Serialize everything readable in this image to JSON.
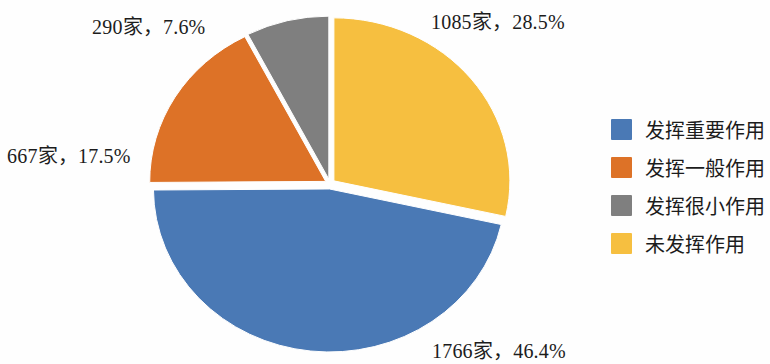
{
  "chart_data": {
    "type": "pie",
    "title": "",
    "subtitle": "",
    "xlabel": "",
    "ylabel": "",
    "legend_position": "right",
    "grid": false,
    "start_angle_deg": 0,
    "direction": "clockwise",
    "exploded": true,
    "unit_suffix": "家",
    "total_count": 3808,
    "categories": [
      "发挥重要作用",
      "发挥一般作用",
      "发挥很小作用",
      "未发挥作用"
    ],
    "values": [
      1766,
      667,
      290,
      1085
    ],
    "percentages": [
      46.4,
      17.5,
      7.6,
      28.5
    ],
    "colors": [
      "#4a79b5",
      "#dd7227",
      "#7f7f7f",
      "#f6bf40"
    ],
    "slices": [
      {
        "name": "发挥重要作用",
        "count": 1766,
        "percent": 46.4,
        "color": "#4a79b5",
        "label": "1766家，46.4%"
      },
      {
        "name": "发挥一般作用",
        "count": 667,
        "percent": 17.5,
        "color": "#dd7227",
        "label": "667家，17.5%"
      },
      {
        "name": "发挥很小作用",
        "count": 290,
        "percent": 7.6,
        "color": "#7f7f7f",
        "label": "290家，7.6%"
      },
      {
        "name": "未发挥作用",
        "count": 1085,
        "percent": 28.5,
        "color": "#f6bf40",
        "label": "1085家，28.5%"
      }
    ]
  },
  "labels": {
    "yellow": "1085家，28.5%",
    "gray": "290家，7.6%",
    "orange": "667家，17.5%",
    "blue": "1766家，46.4%"
  },
  "legend": {
    "items": [
      {
        "label": "发挥重要作用",
        "color": "#4a79b5"
      },
      {
        "label": "发挥一般作用",
        "color": "#dd7227"
      },
      {
        "label": "发挥很小作用",
        "color": "#7f7f7f"
      },
      {
        "label": "未发挥作用",
        "color": "#f6bf40"
      }
    ]
  },
  "canvas": {
    "background": "#fefefe",
    "text_color": "#1c1c1c"
  }
}
